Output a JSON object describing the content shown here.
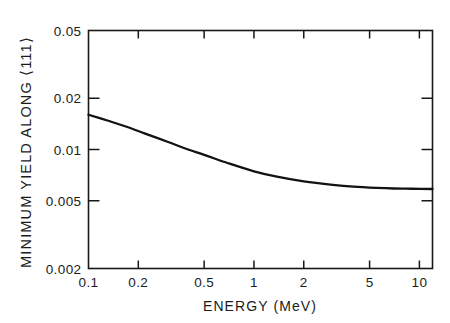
{
  "chart_data": {
    "type": "line",
    "title": "",
    "xlabel": "ENERGY (MeV)",
    "ylabel": "MINIMUM YIELD ALONG ⟨111⟩",
    "xscale": "log",
    "yscale": "log",
    "xlim": [
      0.1,
      12
    ],
    "ylim": [
      0.002,
      0.05
    ],
    "grid": false,
    "legend": null,
    "xticks": [
      0.1,
      0.2,
      0.5,
      1,
      2,
      5,
      10
    ],
    "xticklabels": [
      "0.1",
      "0.2",
      "0.5",
      "1",
      "2",
      "5",
      "10"
    ],
    "yticks": [
      0.002,
      0.005,
      0.01,
      0.02,
      0.05
    ],
    "yticklabels": [
      "0.002",
      "0.005",
      "0.01",
      "0.02",
      "0.05"
    ],
    "series": [
      {
        "name": "minimum yield",
        "x": [
          0.1,
          0.13,
          0.17,
          0.22,
          0.3,
          0.4,
          0.5,
          0.7,
          1.0,
          1.4,
          2.0,
          3.0,
          4.0,
          5.5,
          7.0,
          9.0,
          12.0
        ],
        "y": [
          0.016,
          0.0148,
          0.0136,
          0.0124,
          0.0111,
          0.01,
          0.0093,
          0.0083,
          0.00745,
          0.0069,
          0.0065,
          0.0062,
          0.00605,
          0.00595,
          0.0059,
          0.00588,
          0.00586
        ]
      }
    ],
    "annotations": []
  },
  "axes": {
    "x_title": "ENERGY (MeV)",
    "y_title": "MINIMUM YIELD ALONG ⟨111⟩"
  },
  "ticks": {
    "x": [
      {
        "label": "0.1",
        "value": 0.1
      },
      {
        "label": "0.2",
        "value": 0.2
      },
      {
        "label": "0.5",
        "value": 0.5
      },
      {
        "label": "1",
        "value": 1
      },
      {
        "label": "2",
        "value": 2
      },
      {
        "label": "5",
        "value": 5
      },
      {
        "label": "10",
        "value": 10
      }
    ],
    "y": [
      {
        "label": "0.05",
        "value": 0.05
      },
      {
        "label": "0.02",
        "value": 0.02
      },
      {
        "label": "0.01",
        "value": 0.01
      },
      {
        "label": "0.005",
        "value": 0.005
      },
      {
        "label": "0.002",
        "value": 0.002
      }
    ]
  },
  "style": {
    "line_color": "#121212",
    "axis_color": "#181818",
    "background": "#ffffff"
  }
}
